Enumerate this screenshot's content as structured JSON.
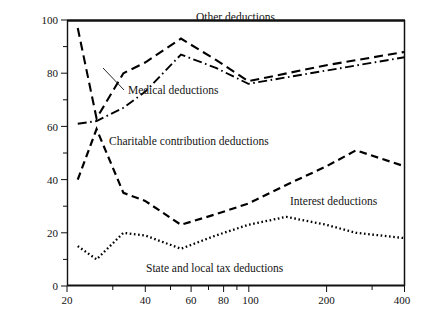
{
  "figure": {
    "background_color": "#ffffff",
    "line_color": "#000000",
    "frame_color": "#111111"
  },
  "chart_data": {
    "type": "line",
    "title": "",
    "subtitle": "",
    "xlabel": "",
    "ylabel": "",
    "xscale": "log",
    "yscale": "linear",
    "xlim": [
      20,
      400
    ],
    "ylim": [
      0,
      100
    ],
    "grid": false,
    "legend_position": "inline-annotations",
    "x_tick_labels": [
      "20",
      "40",
      "60",
      "80",
      "100",
      "200",
      "400"
    ],
    "x_tick_values": [
      20,
      40,
      60,
      80,
      100,
      200,
      400
    ],
    "x_minor_tick_values": [
      30,
      50,
      70,
      90,
      300
    ],
    "y_tick_labels": [
      "0",
      "20",
      "40",
      "60",
      "80",
      "100"
    ],
    "y_tick_values": [
      0,
      20,
      40,
      60,
      80,
      100
    ],
    "y_minor_tick_values": [
      10,
      30,
      50,
      70,
      90
    ],
    "series": [
      {
        "name": "Other deductions",
        "line_style": "long-dash",
        "dash_pattern": "9,5",
        "stroke_width": 2.1,
        "x": [
          22,
          26,
          33,
          40,
          55,
          75,
          100,
          200,
          400
        ],
        "values": [
          97,
          63,
          80,
          84,
          93,
          85,
          77,
          83,
          88
        ]
      },
      {
        "name": "Medical deductions",
        "line_style": "dash-dot",
        "dash_pattern": "9,3.5,1.6,3.5",
        "stroke_width": 1.9,
        "x": [
          22,
          26,
          33,
          40,
          55,
          75,
          100,
          200,
          400
        ],
        "values": [
          61,
          62,
          67,
          73,
          87,
          82,
          76,
          81,
          86
        ]
      },
      {
        "name": "Interest deductions",
        "alt_name": "Charitable contribution deductions",
        "line_style": "dash",
        "dash_pattern": "7.5,4.5",
        "stroke_width": 2.2,
        "x": [
          22,
          26,
          33,
          40,
          55,
          75,
          100,
          140,
          200,
          260,
          400
        ],
        "values": [
          40,
          59,
          35,
          32,
          23,
          27,
          31,
          38,
          45,
          51,
          45
        ]
      },
      {
        "name": "State and local tax deductions",
        "line_style": "dotted",
        "dash_pattern": "1.6,2.6",
        "stroke_width": 2.3,
        "x": [
          22,
          26,
          33,
          40,
          55,
          75,
          100,
          140,
          200,
          260,
          400
        ],
        "values": [
          15,
          10,
          20,
          19,
          14,
          19,
          23,
          26,
          23,
          20,
          18
        ]
      }
    ],
    "annotations": [
      {
        "id": "other-deductions-label",
        "text": "Other deductions",
        "x_px": 196,
        "y_px": 21
      },
      {
        "id": "medical-deductions-label",
        "text": "Medical deductions",
        "x_px": 128,
        "y_px": 94
      },
      {
        "id": "charitable-contribution-deductions-label",
        "text": "Charitable contribution deductions",
        "x_px": 109,
        "y_px": 145
      },
      {
        "id": "interest-deductions-label",
        "text": "Interest deductions",
        "x_px": 290,
        "y_px": 205
      },
      {
        "id": "state-and-local-tax-deductions-label",
        "text": "State and local tax deductions",
        "x_px": 146,
        "y_px": 272
      }
    ]
  }
}
